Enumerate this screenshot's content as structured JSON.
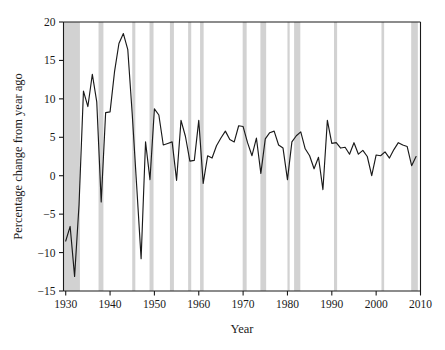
{
  "chart_data": {
    "type": "line",
    "title": "",
    "xlabel": "Year",
    "ylabel": "Percentage change from year ago",
    "xlim": [
      1929.5,
      2010.0
    ],
    "ylim": [
      -15,
      20
    ],
    "grid": false,
    "legend": "none",
    "xticks": [
      1930,
      1940,
      1950,
      1960,
      1970,
      1980,
      1990,
      2000,
      2010
    ],
    "xtick_labels": [
      "1930",
      "1940",
      "1950",
      "1960",
      "1970",
      "1980",
      "1990",
      "2000",
      "2010"
    ],
    "yticks": [
      -15,
      -10,
      -5,
      0,
      5,
      10,
      15,
      20
    ],
    "ytick_labels": [
      "−15",
      "−10",
      "−5",
      "0",
      "5",
      "10",
      "15",
      "20"
    ],
    "series": [
      {
        "name": "Percentage change from year ago",
        "color": "#1a1a1a",
        "x": [
          1930,
          1931,
          1932,
          1933,
          1934,
          1935,
          1936,
          1937,
          1938,
          1939,
          1940,
          1941,
          1942,
          1943,
          1944,
          1945,
          1946,
          1947,
          1948,
          1949,
          1950,
          1951,
          1952,
          1953,
          1954,
          1955,
          1956,
          1957,
          1958,
          1959,
          1960,
          1961,
          1962,
          1963,
          1964,
          1965,
          1966,
          1967,
          1968,
          1969,
          1970,
          1971,
          1972,
          1973,
          1974,
          1975,
          1976,
          1977,
          1978,
          1979,
          1980,
          1981,
          1982,
          1983,
          1984,
          1985,
          1986,
          1987,
          1988,
          1989,
          1990,
          1991,
          1992,
          1993,
          1994,
          1995,
          1996,
          1997,
          1998,
          1999,
          2000,
          2001,
          2002,
          2003,
          2004,
          2005,
          2006,
          2007,
          2008,
          2009
        ],
        "values": [
          -8.5,
          -6.6,
          -13.1,
          -3.8,
          11.0,
          9.0,
          13.2,
          9.6,
          -3.4,
          8.2,
          8.3,
          13.5,
          17.2,
          18.5,
          16.4,
          8.0,
          -1.3,
          -10.8,
          4.4,
          -0.5,
          8.7,
          7.9,
          4.0,
          4.2,
          4.4,
          -0.6,
          7.2,
          5.1,
          1.9,
          2.0,
          7.2,
          -1.0,
          2.6,
          2.3,
          3.9,
          4.9,
          5.8,
          4.7,
          4.4,
          6.5,
          6.4,
          4.3,
          2.6,
          4.9,
          0.3,
          4.8,
          5.6,
          5.8,
          4.0,
          3.6,
          -0.5,
          4.4,
          5.2,
          5.7,
          3.5,
          2.6,
          0.9,
          2.4,
          -1.8,
          7.2,
          4.2,
          4.3,
          3.6,
          3.7,
          2.8,
          4.3,
          2.8,
          3.3,
          2.5,
          0.0,
          2.7,
          2.6,
          3.1,
          2.3,
          3.4,
          4.3,
          4.0,
          3.8,
          1.3,
          2.5
        ]
      }
    ],
    "recession_bands": [
      {
        "start": 1929.6,
        "end": 1933.2
      },
      {
        "start": 1937.4,
        "end": 1938.5
      },
      {
        "start": 1945.0,
        "end": 1945.7
      },
      {
        "start": 1948.9,
        "end": 1949.8
      },
      {
        "start": 1953.5,
        "end": 1954.4
      },
      {
        "start": 1957.6,
        "end": 1958.3
      },
      {
        "start": 1960.3,
        "end": 1961.1
      },
      {
        "start": 1969.9,
        "end": 1970.8
      },
      {
        "start": 1973.9,
        "end": 1975.2
      },
      {
        "start": 1980.0,
        "end": 1980.5
      },
      {
        "start": 1981.5,
        "end": 1982.9
      },
      {
        "start": 1990.5,
        "end": 1991.2
      },
      {
        "start": 2001.2,
        "end": 2001.8
      },
      {
        "start": 2007.9,
        "end": 2009.4
      }
    ],
    "recession_band_color": "#d2d2d2"
  },
  "axes": {
    "y_axis_title": "Percentage change from year ago",
    "x_axis_title": "Year"
  }
}
